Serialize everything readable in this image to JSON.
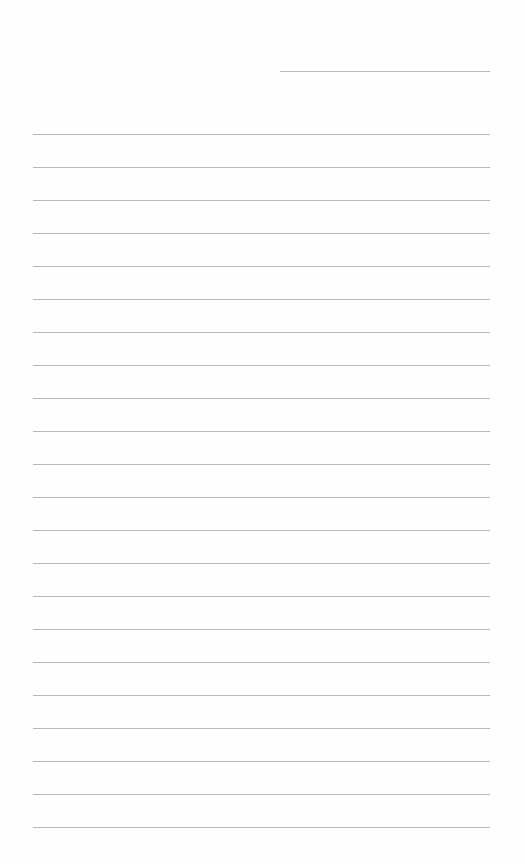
{
  "page": {
    "type": "lined-paper",
    "background": "#fefefe",
    "line_color": "#b8b8b8",
    "header_line": {
      "x": 280,
      "y": 71,
      "width": 210
    },
    "ruled_lines": {
      "x": 33,
      "width": 457,
      "start_y": 134,
      "spacing": 33,
      "count": 22
    }
  }
}
